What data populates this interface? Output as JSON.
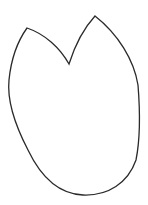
{
  "shape": {
    "type": "lily-pad-outline",
    "stroke_color": "#2a2a2a",
    "fill_color": "#ffffff",
    "background": "#ffffff"
  }
}
